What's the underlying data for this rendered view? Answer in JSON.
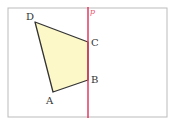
{
  "diagram": {
    "frame": {
      "x": 8,
      "y": 8,
      "width": 159,
      "height": 109,
      "stroke": "#bbbbbb"
    },
    "line": {
      "label": "p",
      "x": 88,
      "color": "#e03a62"
    },
    "polygon": {
      "fill": "#fdf8c8",
      "stroke": "#333333",
      "vertices": [
        {
          "name": "A",
          "x": 53,
          "y": 92,
          "lx": 46,
          "ly": 104
        },
        {
          "name": "B",
          "x": 88,
          "y": 80,
          "lx": 92,
          "ly": 83
        },
        {
          "name": "C",
          "x": 88,
          "y": 42,
          "lx": 92,
          "ly": 46
        },
        {
          "name": "D",
          "x": 35,
          "y": 22,
          "lx": 26,
          "ly": 20
        }
      ]
    }
  }
}
